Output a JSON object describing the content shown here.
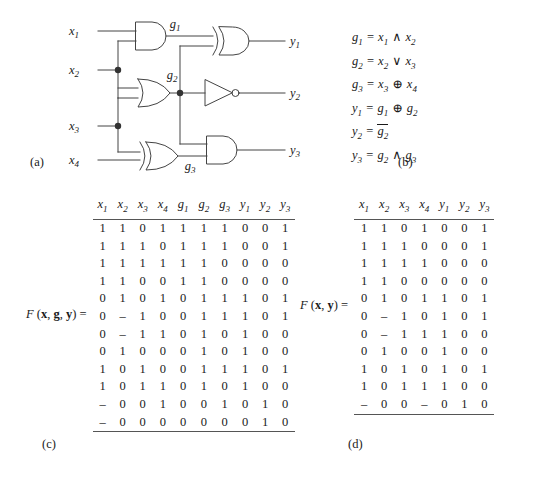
{
  "figure": {
    "captions": {
      "a": "(a)",
      "b": "(b)",
      "c": "(c)",
      "d": "(d)"
    }
  },
  "circuit": {
    "inputs": [
      "x1",
      "x2",
      "x3",
      "x4"
    ],
    "outputs": [
      "y1",
      "y2",
      "y3"
    ],
    "internal_labels": [
      "g1",
      "g2",
      "g3"
    ],
    "gates": [
      {
        "name": "and-gate-g1",
        "type": "AND",
        "inputs": [
          "x1",
          "x2"
        ],
        "output": "g1"
      },
      {
        "name": "or-gate-g2",
        "type": "OR",
        "inputs": [
          "x2",
          "x3"
        ],
        "output": "g2"
      },
      {
        "name": "xor-gate-g3",
        "type": "XOR",
        "inputs": [
          "x3",
          "x4"
        ],
        "output": "g3"
      },
      {
        "name": "xor-gate-y1",
        "type": "XOR",
        "inputs": [
          "g1",
          "g2"
        ],
        "output": "y1"
      },
      {
        "name": "not-gate-y2",
        "type": "NOT",
        "inputs": [
          "g2"
        ],
        "output": "y2"
      },
      {
        "name": "and-gate-y3",
        "type": "AND",
        "inputs": [
          "g2",
          "g3"
        ],
        "output": "y3"
      }
    ],
    "label_x1": "x",
    "label_x1_sub": "1",
    "label_x2": "x",
    "label_x2_sub": "2",
    "label_x3": "x",
    "label_x3_sub": "3",
    "label_x4": "x",
    "label_x4_sub": "4",
    "label_y1": "y",
    "label_y1_sub": "1",
    "label_y2": "y",
    "label_y2_sub": "2",
    "label_y3": "y",
    "label_y3_sub": "3",
    "label_g1": "g",
    "label_g1_sub": "1",
    "label_g2": "g",
    "label_g2_sub": "2",
    "label_g3": "g",
    "label_g3_sub": "3"
  },
  "equations": [
    {
      "lhs": "g",
      "lhs_sub": "1",
      "rhs": "x1 ∧ x2",
      "a": "x",
      "a_sub": "1",
      "op": "∧",
      "b": "x",
      "b_sub": "2",
      "overline": false
    },
    {
      "lhs": "g",
      "lhs_sub": "2",
      "rhs": "x2 ∨ x3",
      "a": "x",
      "a_sub": "2",
      "op": "∨",
      "b": "x",
      "b_sub": "3",
      "overline": false
    },
    {
      "lhs": "g",
      "lhs_sub": "3",
      "rhs": "x3 ⊕ x4",
      "a": "x",
      "a_sub": "3",
      "op": "⊕",
      "b": "x",
      "b_sub": "4",
      "overline": false
    },
    {
      "lhs": "y",
      "lhs_sub": "1",
      "rhs": "g1 ⊕ g2",
      "a": "g",
      "a_sub": "1",
      "op": "⊕",
      "b": "g",
      "b_sub": "2",
      "overline": false
    },
    {
      "lhs": "y",
      "lhs_sub": "2",
      "rhs": "not g2",
      "a": "g",
      "a_sub": "2",
      "op": "",
      "b": "",
      "b_sub": "",
      "overline": true
    },
    {
      "lhs": "y",
      "lhs_sub": "3",
      "rhs": "g2 ∧ g3",
      "a": "g",
      "a_sub": "2",
      "op": "∧",
      "b": "g",
      "b_sub": "3",
      "overline": false
    }
  ],
  "table_c": {
    "function_label": "F (x, g, y) =",
    "fn_name": "F",
    "fn_args": "(x, g, y)",
    "fn_equals": "=",
    "headers": [
      "x1",
      "x2",
      "x3",
      "x4",
      "g1",
      "g2",
      "g3",
      "y1",
      "y2",
      "y3"
    ],
    "header_parts": [
      {
        "base": "x",
        "sub": "1"
      },
      {
        "base": "x",
        "sub": "2"
      },
      {
        "base": "x",
        "sub": "3"
      },
      {
        "base": "x",
        "sub": "4"
      },
      {
        "base": "g",
        "sub": "1"
      },
      {
        "base": "g",
        "sub": "2"
      },
      {
        "base": "g",
        "sub": "3"
      },
      {
        "base": "y",
        "sub": "1"
      },
      {
        "base": "y",
        "sub": "2"
      },
      {
        "base": "y",
        "sub": "3"
      }
    ],
    "rows": [
      [
        "1",
        "1",
        "0",
        "1",
        "1",
        "1",
        "1",
        "0",
        "0",
        "1"
      ],
      [
        "1",
        "1",
        "1",
        "0",
        "1",
        "1",
        "1",
        "0",
        "0",
        "1"
      ],
      [
        "1",
        "1",
        "1",
        "1",
        "1",
        "1",
        "0",
        "0",
        "0",
        "0"
      ],
      [
        "1",
        "1",
        "0",
        "0",
        "1",
        "1",
        "0",
        "0",
        "0",
        "0"
      ],
      [
        "0",
        "1",
        "0",
        "1",
        "0",
        "1",
        "1",
        "1",
        "0",
        "1"
      ],
      [
        "0",
        "–",
        "1",
        "0",
        "0",
        "1",
        "1",
        "1",
        "0",
        "1"
      ],
      [
        "0",
        "–",
        "1",
        "1",
        "0",
        "1",
        "0",
        "1",
        "0",
        "0"
      ],
      [
        "0",
        "1",
        "0",
        "0",
        "0",
        "1",
        "0",
        "1",
        "0",
        "0"
      ],
      [
        "1",
        "0",
        "1",
        "0",
        "0",
        "1",
        "1",
        "1",
        "0",
        "1"
      ],
      [
        "1",
        "0",
        "1",
        "1",
        "0",
        "1",
        "0",
        "1",
        "0",
        "0"
      ],
      [
        "–",
        "0",
        "0",
        "1",
        "0",
        "0",
        "1",
        "0",
        "1",
        "0"
      ],
      [
        "–",
        "0",
        "0",
        "0",
        "0",
        "0",
        "0",
        "0",
        "1",
        "0"
      ]
    ]
  },
  "table_d": {
    "function_label": "F (x, y) =",
    "fn_name": "F",
    "fn_args": "(x, y)",
    "fn_equals": "=",
    "headers": [
      "x1",
      "x2",
      "x3",
      "x4",
      "y1",
      "y2",
      "y3"
    ],
    "header_parts": [
      {
        "base": "x",
        "sub": "1"
      },
      {
        "base": "x",
        "sub": "2"
      },
      {
        "base": "x",
        "sub": "3"
      },
      {
        "base": "x",
        "sub": "4"
      },
      {
        "base": "y",
        "sub": "1"
      },
      {
        "base": "y",
        "sub": "2"
      },
      {
        "base": "y",
        "sub": "3"
      }
    ],
    "rows": [
      [
        "1",
        "1",
        "0",
        "1",
        "0",
        "0",
        "1"
      ],
      [
        "1",
        "1",
        "1",
        "0",
        "0",
        "0",
        "1"
      ],
      [
        "1",
        "1",
        "1",
        "1",
        "0",
        "0",
        "0"
      ],
      [
        "1",
        "1",
        "0",
        "0",
        "0",
        "0",
        "0"
      ],
      [
        "0",
        "1",
        "0",
        "1",
        "1",
        "0",
        "1"
      ],
      [
        "0",
        "–",
        "1",
        "0",
        "1",
        "0",
        "1"
      ],
      [
        "0",
        "–",
        "1",
        "1",
        "1",
        "0",
        "0"
      ],
      [
        "0",
        "1",
        "0",
        "0",
        "1",
        "0",
        "0"
      ],
      [
        "1",
        "0",
        "1",
        "0",
        "1",
        "0",
        "1"
      ],
      [
        "1",
        "0",
        "1",
        "1",
        "1",
        "0",
        "0"
      ],
      [
        "–",
        "0",
        "0",
        "–",
        "0",
        "1",
        "0"
      ]
    ]
  },
  "colors": {
    "ink": "#1a1a1a",
    "rule": "#555555",
    "wire": "#444444",
    "background": "#ffffff"
  }
}
